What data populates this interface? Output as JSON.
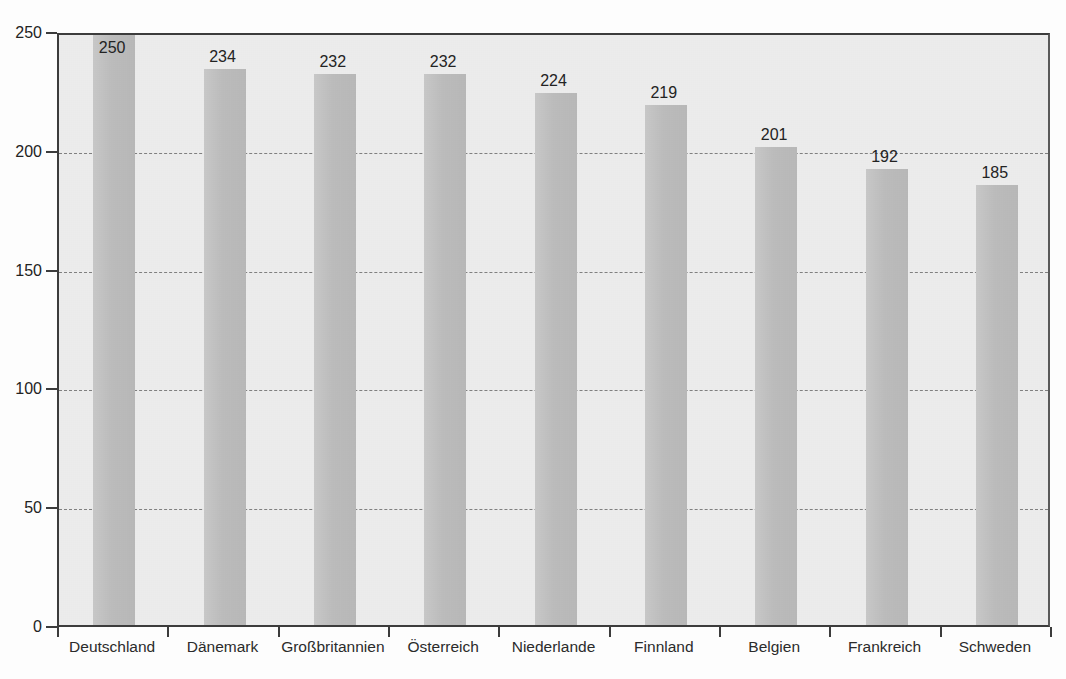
{
  "chart_data": {
    "type": "bar",
    "title": "",
    "subtitle": "",
    "xlabel": "",
    "ylabel": "",
    "categories": [
      "Deutschland",
      "Dänemark",
      "Großbritannien",
      "Österreich",
      "Niederlande",
      "Finnland",
      "Belgien",
      "Frankreich",
      "Schweden"
    ],
    "values": [
      250,
      234,
      232,
      232,
      224,
      219,
      201,
      192,
      185
    ],
    "data_labels": [
      "250",
      "234",
      "232",
      "232",
      "224",
      "219",
      "201",
      "192",
      "185"
    ],
    "ylim": [
      0,
      250
    ],
    "y_ticks": [
      0,
      50,
      100,
      150,
      200,
      250
    ],
    "y_tick_labels": [
      "0",
      "50",
      "100",
      "150",
      "200",
      "250"
    ],
    "grid": true,
    "grid_axis": "y",
    "grid_style": "dashed",
    "legend": false,
    "legend_position": "none",
    "bar_color": "#c2c2c2",
    "plot_background": "#ececec",
    "axis_color": "#3c3c3c",
    "text_color": "#232323"
  }
}
